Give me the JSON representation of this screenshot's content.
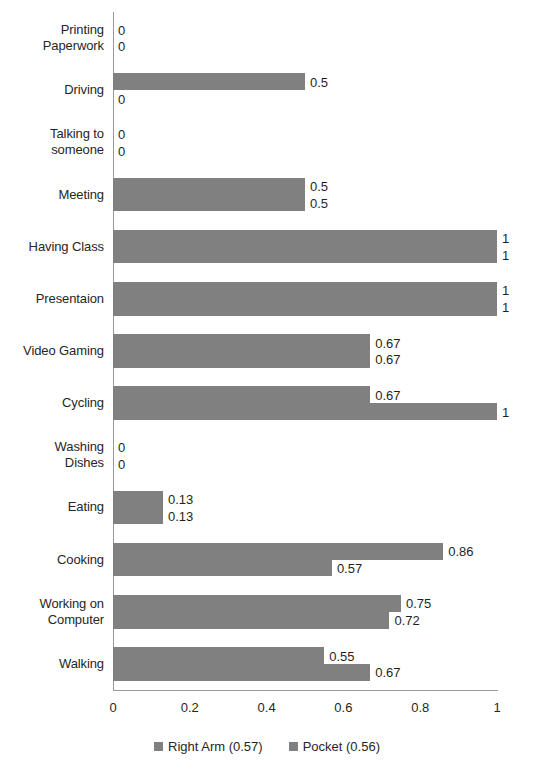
{
  "chart_data": {
    "type": "bar",
    "orientation": "horizontal",
    "title": "",
    "xlabel": "",
    "ylabel": "",
    "xlim": [
      0,
      1
    ],
    "xticks": [
      "0",
      "0.2",
      "0.4",
      "0.6",
      "0.8",
      "1"
    ],
    "xtick_values": [
      0,
      0.2,
      0.4,
      0.6,
      0.8,
      1
    ],
    "grid": false,
    "legend_position": "bottom",
    "categories": [
      "Printing Paperwork",
      "Driving",
      "Talking to someone",
      "Meeting",
      "Having Class",
      "Presentaion",
      "Video Gaming",
      "Cycling",
      "Washing Dishes",
      "Eating",
      "Cooking",
      "Working on Computer",
      "Walking"
    ],
    "category_lines": [
      [
        "Printing",
        "Paperwork"
      ],
      [
        "Driving"
      ],
      [
        "Talking to",
        "someone"
      ],
      [
        "Meeting"
      ],
      [
        "Having Class"
      ],
      [
        "Presentaion"
      ],
      [
        "Video Gaming"
      ],
      [
        "Cycling"
      ],
      [
        "Washing",
        "Dishes"
      ],
      [
        "Eating"
      ],
      [
        "Cooking"
      ],
      [
        "Working on",
        "Computer"
      ],
      [
        "Walking"
      ]
    ],
    "series": [
      {
        "name": "Right Arm (0.57)",
        "short_name": "Right Arm",
        "mean": "0.57",
        "color": "#808080",
        "values": [
          0,
          0.5,
          0,
          0.5,
          1,
          1,
          0.67,
          0.67,
          0,
          0.13,
          0.86,
          0.75,
          0.55
        ],
        "labels": [
          "0",
          "0.5",
          "0",
          "0.5",
          "1",
          "1",
          "0.67",
          "0.67",
          "0",
          "0.13",
          "0.86",
          "0.75",
          "0.55"
        ]
      },
      {
        "name": "Pocket (0.56)",
        "short_name": "Pocket",
        "mean": "0.56",
        "color": "#808080",
        "values": [
          0,
          0,
          0,
          0.5,
          1,
          1,
          0.67,
          1,
          0,
          0.13,
          0.57,
          0.72,
          0.67
        ],
        "labels": [
          "0",
          "0",
          "0",
          "0.5",
          "1",
          "1",
          "0.67",
          "1",
          "0",
          "0.13",
          "0.57",
          "0.72",
          "0.67"
        ]
      }
    ]
  },
  "legend": {
    "items": [
      {
        "label": "Right Arm (0.57)",
        "color": "#808080"
      },
      {
        "label": "Pocket (0.56)",
        "color": "#808080"
      }
    ]
  }
}
